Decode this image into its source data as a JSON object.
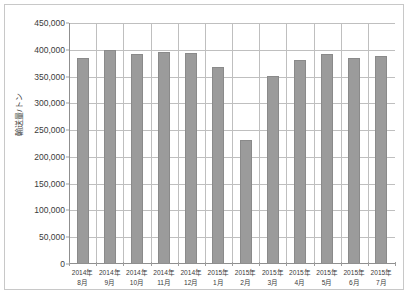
{
  "chart_data": {
    "type": "bar",
    "title": "",
    "xlabel": "",
    "ylabel": "輸送量/トン",
    "ylim": [
      0,
      450000
    ],
    "ytick_step": 50000,
    "grid": true,
    "legend": "none",
    "bar_color": "#9b9b9b",
    "gridline_color": "#bfbfbf",
    "axis_color": "#8f8f8f",
    "categories": [
      "2014年\n8月",
      "2014年\n9月",
      "2014年\n10月",
      "2014年\n11月",
      "2014年\n12月",
      "2015年\n1月",
      "2015年\n2月",
      "2015年\n3月",
      "2015年\n4月",
      "2015年\n5月",
      "2015年\n6月",
      "2015年\n7月"
    ],
    "category_lines": [
      [
        "2014年",
        "8月"
      ],
      [
        "2014年",
        "9月"
      ],
      [
        "2014年",
        "10月"
      ],
      [
        "2014年",
        "11月"
      ],
      [
        "2014年",
        "12月"
      ],
      [
        "2015年",
        "1月"
      ],
      [
        "2015年",
        "2月"
      ],
      [
        "2015年",
        "3月"
      ],
      [
        "2015年",
        "4月"
      ],
      [
        "2015年",
        "5月"
      ],
      [
        "2015年",
        "6月"
      ],
      [
        "2015年",
        "7月"
      ]
    ],
    "values": [
      385000,
      400000,
      392000,
      395000,
      394000,
      368000,
      232000,
      352000,
      381000,
      393000,
      384000,
      389000
    ],
    "ytick_labels": [
      "450,000",
      "400,000",
      "350,000",
      "300,000",
      "250,000",
      "200,000",
      "150,000",
      "100,000",
      "50,000",
      "0"
    ],
    "ytick_values": [
      450000,
      400000,
      350000,
      300000,
      250000,
      200000,
      150000,
      100000,
      50000,
      0
    ]
  }
}
